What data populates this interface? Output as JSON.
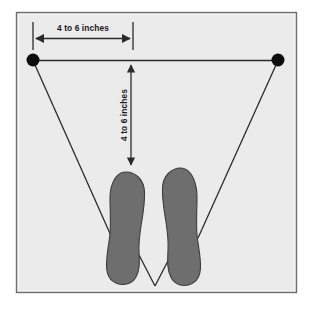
{
  "diagram": {
    "frame": {
      "border_color": "#6f6f6f",
      "background_color": "#ebebeb",
      "outer_background": "#ffffff"
    },
    "colors": {
      "foot_fill": "#6e6e6e",
      "foot_stroke": "#3d3d3d",
      "line_color": "#2b2b2b",
      "marker_color": "#0d0d0d",
      "label_color": "#1a1a1a"
    },
    "annotations": {
      "horizontal_dimension_label": "4 to 6 inches",
      "vertical_dimension_label": "4 to 6 inches"
    },
    "markers": [
      {
        "name": "left-hip-marker",
        "cx": 33,
        "cy": 60,
        "r": 6.5
      },
      {
        "name": "right-hip-marker",
        "cx": 278,
        "cy": 60,
        "r": 6.5
      }
    ],
    "geometry": {
      "frame_x": 16,
      "frame_y": 12,
      "frame_width": 281,
      "frame_height": 281,
      "shoulder_line": {
        "x1": 33,
        "y1": 60,
        "x2": 278,
        "y2": 60
      },
      "horizontal_dim": {
        "x1": 33,
        "x2": 133,
        "y": 38,
        "tick_top": 22,
        "tick_bottom": 50
      },
      "vertical_dim": {
        "x": 131,
        "y1": 62,
        "y2": 168
      },
      "v_apex": {
        "x": 155,
        "y": 286
      },
      "left_foot_bounds": {
        "x": 107,
        "y": 172,
        "width": 38,
        "height": 113
      },
      "right_foot_bounds": {
        "x": 162,
        "y": 168,
        "width": 38,
        "height": 117
      }
    }
  }
}
